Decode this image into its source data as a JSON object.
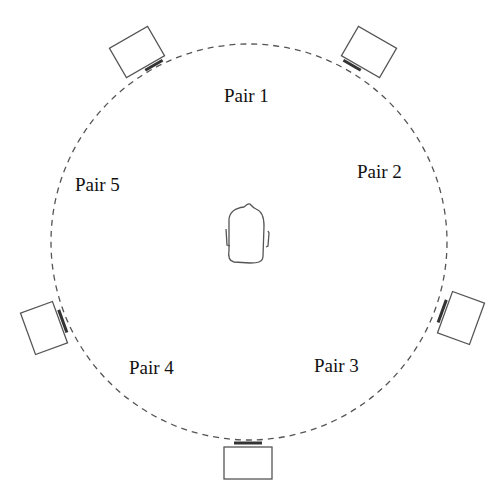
{
  "diagram": {
    "type": "speaker-layout",
    "circle": {
      "cx": 249,
      "cy": 242,
      "r": 198,
      "style": "dashed",
      "color": "#555555"
    },
    "listener": {
      "icon": "listener-head-icon",
      "cx": 247,
      "cy": 235
    },
    "labels": [
      {
        "id": "pair-1",
        "text": "Pair 1",
        "x": 250,
        "y": 102
      },
      {
        "id": "pair-2",
        "text": "Pair 2",
        "x": 384,
        "y": 178
      },
      {
        "id": "pair-3",
        "text": "Pair 3",
        "x": 341,
        "y": 372
      },
      {
        "id": "pair-4",
        "text": "Pair 4",
        "x": 156,
        "y": 374
      },
      {
        "id": "pair-5",
        "text": "Pair 5",
        "x": 101,
        "y": 191
      }
    ],
    "speakers": [
      {
        "id": "speaker-top-left",
        "cx": 137,
        "cy": 55,
        "angle": -30
      },
      {
        "id": "speaker-top-right",
        "cx": 369,
        "cy": 55,
        "angle": 30
      },
      {
        "id": "speaker-right",
        "cx": 460,
        "cy": 318,
        "angle": 110
      },
      {
        "id": "speaker-bottom",
        "cx": 248,
        "cy": 462,
        "angle": 180
      },
      {
        "id": "speaker-left",
        "cx": 45,
        "cy": 328,
        "angle": -110
      }
    ]
  }
}
